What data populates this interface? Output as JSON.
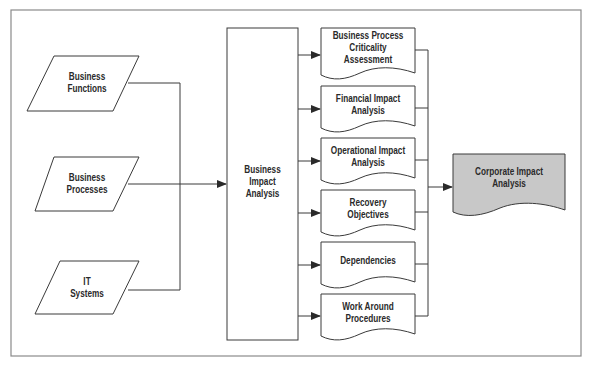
{
  "diagram": {
    "colors": {
      "stroke": "#3a3a3a",
      "frame": "#8a8a8a",
      "output_fill": "#c8c8c8",
      "background": "#ffffff"
    },
    "inputs": [
      {
        "line1": "Business",
        "line2": "Functions"
      },
      {
        "line1": "Business",
        "line2": "Processes"
      },
      {
        "line1": "IT",
        "line2": "Systems"
      }
    ],
    "central": {
      "line1": "Business",
      "line2": "Impact",
      "line3": "Analysis"
    },
    "components": [
      {
        "line1": "Business Process",
        "line2": "Criticality",
        "line3": "Assessment"
      },
      {
        "line1": "Financial Impact",
        "line2": "Analysis",
        "line3": ""
      },
      {
        "line1": "Operational Impact",
        "line2": "Analysis",
        "line3": ""
      },
      {
        "line1": "Recovery",
        "line2": "Objectives",
        "line3": ""
      },
      {
        "line1": "Dependencies",
        "line2": "",
        "line3": ""
      },
      {
        "line1": "Work Around",
        "line2": "Procedures",
        "line3": ""
      }
    ],
    "output": {
      "line1": "Corporate Impact",
      "line2": "Analysis"
    }
  }
}
